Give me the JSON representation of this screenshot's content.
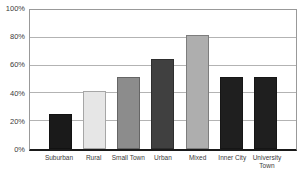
{
  "chart_data": {
    "type": "bar",
    "title": "",
    "xlabel": "",
    "ylabel": "",
    "categories": [
      "Suburban",
      "Rural",
      "Small Town",
      "Urban",
      "Mixed",
      "Inner City",
      "University Town"
    ],
    "values": [
      25,
      42,
      52,
      65,
      82,
      52,
      52
    ],
    "unit": "%",
    "bar_colors": [
      "#1a1a1a",
      "#e6e6e6",
      "#8c8c8c",
      "#404040",
      "#aeaeae",
      "#1f1f1f",
      "#1f1f1f"
    ],
    "xtick_lines": [
      [
        "Suburban"
      ],
      [
        "Rural"
      ],
      [
        "Small Town"
      ],
      [
        "Urban"
      ],
      [
        "Mixed"
      ],
      [
        "Inner City"
      ],
      [
        "University",
        "Town"
      ]
    ],
    "ytick_labels": [
      "0%",
      "20%",
      "40%",
      "60%",
      "80%",
      "100%"
    ],
    "ylim": [
      0,
      100
    ],
    "grid": true,
    "legend": false,
    "gridline_color": "#b3b3b3",
    "plot_border_color": "#999999",
    "axis_line_color": "#1a1a1a",
    "label_color": "#3a3a3a",
    "background_color": "#ffffff"
  }
}
